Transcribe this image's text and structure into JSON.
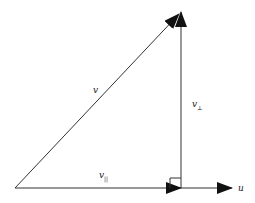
{
  "diagram": {
    "type": "vector-projection",
    "colors": {
      "line": "#333333",
      "label": "#222222",
      "background": "#ffffff"
    },
    "labels": {
      "v": "v",
      "v_parallel_base": "v",
      "v_parallel_sub": "||",
      "v_perp_base": "v",
      "v_perp_sub": "⊥",
      "u": "u"
    },
    "points": {
      "origin": [
        15,
        188
      ],
      "apex": [
        181,
        12
      ],
      "foot": [
        181,
        188
      ],
      "u_tip": [
        232,
        188
      ]
    }
  }
}
